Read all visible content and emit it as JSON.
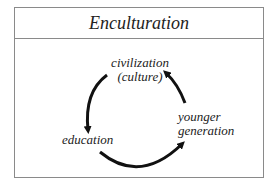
{
  "diagram": {
    "title": "Enculturation",
    "nodes": [
      {
        "id": "civilization",
        "line1": "civilization",
        "line2": "(culture)"
      },
      {
        "id": "younger",
        "line1": "younger",
        "line2": "generation"
      },
      {
        "id": "education",
        "line1": "education"
      }
    ],
    "edges": [
      {
        "from": "civilization",
        "to": "education"
      },
      {
        "from": "education",
        "to": "younger"
      },
      {
        "from": "younger",
        "to": "civilization"
      }
    ],
    "colors": {
      "border": "#8a8a8a",
      "arrow": "#111111",
      "text": "#222222"
    }
  }
}
